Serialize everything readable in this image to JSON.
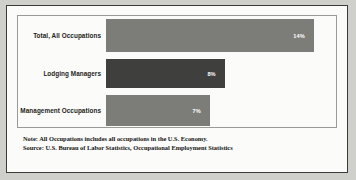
{
  "chart_data": {
    "type": "bar",
    "orientation": "horizontal",
    "title": "",
    "xlabel": "",
    "ylabel": "",
    "categories": [
      "Total, All Occupations",
      "Lodging Managers",
      "Management Occupations"
    ],
    "values": [
      14,
      8,
      7
    ],
    "value_labels": [
      "14%",
      "8%",
      "7%"
    ],
    "xlim": [
      0,
      15.5
    ],
    "grid": false,
    "legend": false,
    "bar_colors": [
      "#7c7c78",
      "#3f3f3d",
      "#7c7c78"
    ],
    "value_label_color": "#ffffff"
  },
  "footnotes": {
    "note": "Note: All Occupations includes all occupations in the U.S. Economy.",
    "source": "Source: U.S. Bureau of Labor Statistics, Occupational Employment Statistics"
  },
  "style": {
    "frame_color": "#3a3a38",
    "plot_border_color": "#9a9a96",
    "background": "#fbfbf9"
  }
}
